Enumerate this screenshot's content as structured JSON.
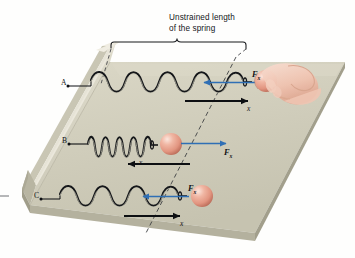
{
  "figure": {
    "caption_line1": "Unstrained length",
    "caption_line2": "of the spring"
  },
  "colors": {
    "surface_top": "#cfccba",
    "surface_top_light": "#dcd9c8",
    "wall_face": "#d7d4c3",
    "wall_top": "#e8e6da",
    "edge_shadow": "#a9a693",
    "ball_fill": "#e8a391",
    "ball_highlight": "#f6d9cf",
    "ball_shadow": "#c06f5d",
    "force_arrow": "#2f6fb5",
    "displacement_arrow": "#0d0f12",
    "spring_dark": "#15171a",
    "spring_light": "#b9b6a6",
    "hand_fill": "#f4cdbd",
    "hand_shadow": "#dba690",
    "dash_line": "#3d3f42",
    "text": "#15171a"
  },
  "rows": [
    {
      "id": "A",
      "label": "A",
      "state": "stretched",
      "coils": 8,
      "force_label": "F",
      "force_sub": "x",
      "force_direction": "left",
      "displacement_label": "x",
      "displacement_direction": "right",
      "has_hand": true
    },
    {
      "id": "B",
      "label": "B",
      "state": "compressed",
      "coils": 9,
      "force_label": "F",
      "force_sub": "x",
      "force_direction": "right",
      "displacement_label": "x",
      "displacement_direction": "left",
      "has_hand": false
    },
    {
      "id": "C",
      "label": "C",
      "state": "stretched",
      "coils": 7,
      "force_label": "F",
      "force_sub": "x",
      "force_direction": "left",
      "displacement_label": "x",
      "displacement_direction": "right",
      "has_hand": false
    }
  ],
  "bracket": {
    "present": true,
    "spans": "unstrained length of the spring"
  },
  "reference_line": {
    "present": true,
    "style": "dashed",
    "meaning": "unstrained spring end position"
  }
}
